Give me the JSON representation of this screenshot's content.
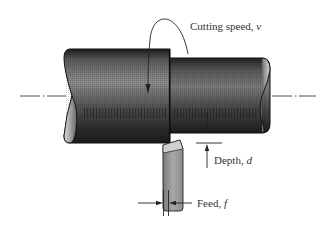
{
  "diagram": {
    "labels": {
      "cutting_speed": "Cutting speed, ",
      "cutting_speed_symbol": "v",
      "depth": "Depth, ",
      "depth_symbol": "d",
      "feed": "Feed, ",
      "feed_symbol": "f"
    },
    "components": {
      "workpiece_large": "Unmachined workpiece section (larger diameter)",
      "workpiece_small": "Machined workpiece section (reduced diameter)",
      "tool": "Cutting tool",
      "centerline": "Axis of rotation"
    },
    "colors": {
      "workpiece_dark": "#2a2a2a",
      "workpiece_mid": "#6a6a6a",
      "workpiece_light": "#a8a8a8",
      "tool_light": "#c8c8c8",
      "tool_mid": "#8a8a8a",
      "line": "#111111",
      "text": "#333333"
    }
  }
}
